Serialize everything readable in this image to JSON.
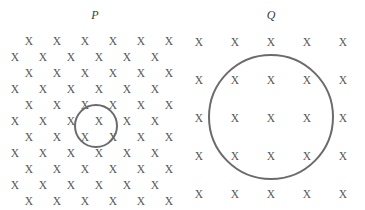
{
  "figure": {
    "background_color": "#ffffff",
    "width": 365,
    "height": 210
  },
  "styles": {
    "x_mark_color": "#555555",
    "loop_stroke_color": "#6b6b6b",
    "label_color": "#3b3b3b",
    "loop_stroke_width": 2
  },
  "panels": [
    {
      "id": "panel-p",
      "label": "P",
      "label_x": 95,
      "label_y": 16,
      "field_symbol": "X",
      "field_direction": "into-page",
      "grid_type": "staggered",
      "rows": 11,
      "marks_per_row": 6,
      "row_spacing": 16,
      "column_spacing": 28,
      "row_y": [
        41,
        57,
        73,
        89,
        105,
        121,
        137,
        153,
        169,
        185,
        201
      ],
      "even_row_start_x": 29,
      "odd_row_start_x": 15,
      "loop": {
        "name": "small-loop",
        "center_x": 96,
        "center_y": 126,
        "radius": 21,
        "enclosed_marks": 4
      }
    },
    {
      "id": "panel-q",
      "label": "Q",
      "label_x": 271,
      "label_y": 16,
      "field_symbol": "X",
      "field_direction": "into-page",
      "grid_type": "regular",
      "rows": 5,
      "columns": 5,
      "column_x": [
        199,
        235,
        271,
        307,
        343
      ],
      "row_y": [
        42,
        80,
        118,
        156,
        194
      ],
      "loop": {
        "name": "large-loop",
        "center_x": 271,
        "center_y": 117,
        "radius": 62,
        "enclosed_marks": 9
      }
    }
  ]
}
